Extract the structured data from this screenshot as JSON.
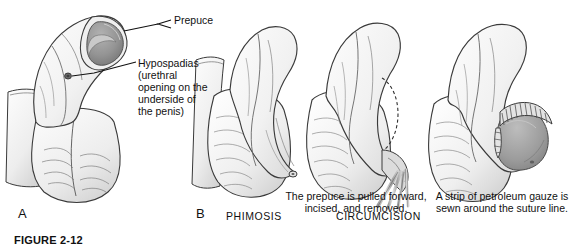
{
  "figure": {
    "domain": "medical-illustration",
    "caption": "FIGURE 2-12",
    "style": "grayscale pencil line art",
    "colors": {
      "ink": "#2b2b2b",
      "skin_light": "#f4f4f4",
      "skin_shade": "#d9d9d9",
      "glans_dark": "#8d8d8d",
      "glans_mid": "#a5a5a5",
      "background": "#ffffff",
      "text": "#111111"
    }
  },
  "labels": {
    "prepuce": "Prepuce",
    "hypospadias": "Hypospadias\n(urethral\nopening on the\nunderside of\nthe penis)",
    "incised_caption": "The prepuce is pulled forward, incised, and removed.",
    "gauze_caption": "A strip of petroleum gauze is sewn around the suture line."
  },
  "panels": [
    {
      "letter": "A",
      "name": "",
      "description": "Penis with hypospadias showing prepuce and ventral urethral opening"
    },
    {
      "letter": "B",
      "name": "PHIMOSIS",
      "description": "Penis with tight non-retractable prepuce and pinpoint opening"
    },
    {
      "letter": "",
      "name": "CIRCUMCISION",
      "description": "Prepuce pulled forward with hemostats, dashed incision line marked"
    },
    {
      "letter": "",
      "name": "",
      "description": "Circumcised penis with exposed glans and petroleum gauze around suture line"
    }
  ],
  "procedure_names": {
    "phimosis": "PHIMOSIS",
    "circumcision": "CIRCUMCISION"
  },
  "icons": {
    "leader_line": "leader-line",
    "arrow_bracket": "bracket-arrow"
  }
}
